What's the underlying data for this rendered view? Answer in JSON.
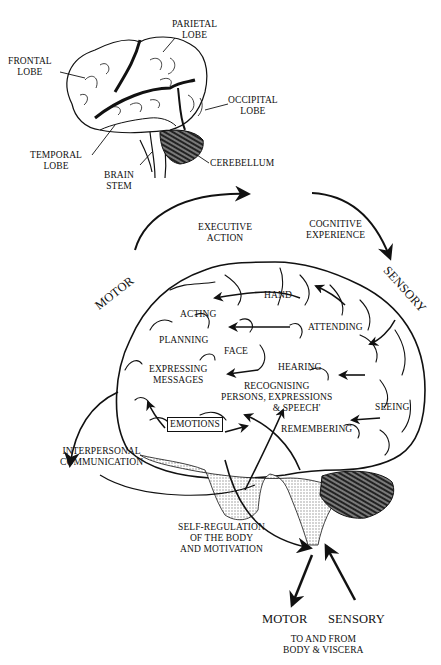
{
  "figure": {
    "top_brain": {
      "labels": {
        "parietal": [
          "PARIETAL",
          "LOBE"
        ],
        "frontal": [
          "FRONTAL",
          "LOBE"
        ],
        "occipital": [
          "OCCIPITAL",
          "LOBE"
        ],
        "temporal": [
          "TEMPORAL",
          "LOBE"
        ],
        "brain_stem": [
          "BRAIN",
          "STEM"
        ],
        "cerebellum": "CEREBELLUM"
      }
    },
    "cycle": {
      "motor": "MOTOR",
      "sensory": "SENSORY",
      "executive_action": [
        "EXECUTIVE",
        "ACTION"
      ],
      "cognitive_experience": [
        "COGNITIVE",
        "EXPERIENCE"
      ]
    },
    "functional_brain": {
      "hand": "HAND",
      "acting": "ACTING",
      "attending": "ATTENDING",
      "planning": "PLANNING",
      "face": "FACE",
      "expressing_messages": [
        "EXPRESSING",
        "MESSAGES"
      ],
      "hearing": "HEARING",
      "recognising": [
        "RECOGNISING",
        "PERSONS, EXPRESSIONS",
        "& SPEECH'"
      ],
      "seeing": "SEEING",
      "emotions": "EMOTIONS",
      "remembering": "REMEMBERING"
    },
    "side_labels": {
      "interpersonal": [
        "INTERPERSONAL",
        "COMMUNICATION"
      ],
      "self_regulation": [
        "SELF-REGULATION",
        "OF THE BODY",
        "AND MOTIVATION"
      ]
    },
    "bottom": {
      "motor": "MOTOR",
      "sensory": "SENSORY",
      "caption": [
        "TO AND FROM",
        "BODY & VISCERA"
      ]
    },
    "colors": {
      "ink": "#111111",
      "paper": "#ffffff",
      "stipple": "#b8b8b8"
    }
  }
}
